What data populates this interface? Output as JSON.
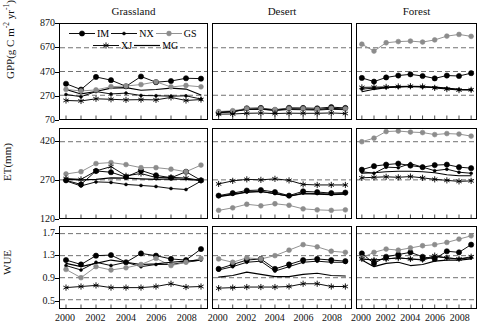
{
  "figure": {
    "column_titles": [
      "Grassland",
      "Desert",
      "Forest"
    ],
    "row_labels": [
      "GPP(g C m-2 yr-1)",
      "ET(mm)",
      "WUE"
    ]
  },
  "legend": {
    "entries": [
      {
        "key": "IM",
        "label": "IM",
        "marker": "circle-large",
        "color": "#000000"
      },
      {
        "key": "NX",
        "label": "NX",
        "marker": "circle-small",
        "color": "#000000"
      },
      {
        "key": "GS",
        "label": "GS",
        "marker": "circle-gray",
        "color": "#8c8c8c"
      },
      {
        "key": "XJ",
        "label": "XJ",
        "marker": "asterisk",
        "color": "#000000"
      },
      {
        "key": "MG",
        "label": "MG",
        "marker": "line",
        "color": "#000000"
      }
    ]
  },
  "axes": {
    "gpp": {
      "label": "GPP(g C m",
      "label_sup1": "-2",
      "label_mid": " yr",
      "label_sup2": "-1",
      "label_end": ")",
      "ticks": [
        70,
        270,
        470,
        670,
        870
      ],
      "min": 70,
      "max": 870
    },
    "et": {
      "label": "ET(mm)",
      "ticks": [
        120,
        270,
        420
      ],
      "min": 120,
      "max": 470
    },
    "wue": {
      "label": "WUE",
      "ticks": [
        0.5,
        0.9,
        1.3,
        1.7
      ],
      "min": 0.35,
      "max": 1.82
    }
  },
  "xaxis": {
    "ticks": [
      "2000",
      "2002",
      "2004",
      "2006",
      "2008"
    ],
    "years": [
      2000,
      2001,
      2002,
      2003,
      2004,
      2005,
      2006,
      2007,
      2008,
      2009
    ],
    "min": 1999.6,
    "max": 2009.4
  },
  "chart_data": {
    "type": "line",
    "title": "",
    "xlabel": "",
    "grid": true,
    "legend_position": "top-left-panel",
    "x": [
      2000,
      2001,
      2002,
      2003,
      2004,
      2005,
      2006,
      2007,
      2008,
      2009
    ],
    "panels": [
      {
        "row": "GPP",
        "column": "Grassland",
        "ylabel": "GPP(g C m-2 yr-1)",
        "ylim": [
          70,
          870
        ],
        "yticks": [
          70,
          270,
          470,
          670,
          870
        ],
        "series": [
          {
            "name": "IM",
            "values": [
              367,
              318,
              424,
              397,
              345,
              428,
              380,
              390,
              413,
              410
            ]
          },
          {
            "name": "NX",
            "values": [
              276,
              258,
              301,
              281,
              288,
              268,
              266,
              262,
              265,
              238
            ]
          },
          {
            "name": "GS",
            "values": [
              319,
              306,
              315,
              342,
              348,
              360,
              383,
              340,
              352,
              341
            ]
          },
          {
            "name": "XJ",
            "values": [
              226,
              222,
              240,
              236,
              231,
              233,
              231,
              252,
              226,
              234
            ]
          },
          {
            "name": "MG",
            "values": [
              318,
              281,
              302,
              330,
              334,
              312,
              318,
              330,
              322,
              272
            ]
          }
        ]
      },
      {
        "row": "GPP",
        "column": "Desert",
        "ylabel": "",
        "ylim": [
          70,
          870
        ],
        "yticks": [
          70,
          270,
          470,
          670,
          870
        ],
        "series": [
          {
            "name": "IM",
            "values": [
              124,
              130,
              160,
              163,
              146,
              164,
              163,
              160,
              170,
              163
            ]
          },
          {
            "name": "NX",
            "values": [
              128,
              135,
              150,
              152,
              142,
              150,
              148,
              145,
              152,
              148
            ]
          },
          {
            "name": "GS",
            "values": [
              133,
              140,
              158,
              158,
              150,
              158,
              157,
              152,
              160,
              156
            ]
          },
          {
            "name": "XJ",
            "values": [
              111,
              112,
              118,
              120,
              116,
              119,
              118,
              118,
              121,
              116
            ]
          },
          {
            "name": "MG",
            "values": [
              126,
              132,
              152,
              155,
              144,
              156,
              154,
              150,
              160,
              152
            ]
          }
        ]
      },
      {
        "row": "GPP",
        "column": "Forest",
        "ylabel": "",
        "ylim": [
          70,
          870
        ],
        "yticks": [
          70,
          270,
          470,
          670,
          870
        ],
        "series": [
          {
            "name": "IM",
            "values": [
              416,
              385,
              420,
              436,
              446,
              432,
              412,
              436,
              432,
              456
            ]
          },
          {
            "name": "NX",
            "values": [
              322,
              330,
              336,
              340,
              344,
              340,
              334,
              326,
              318,
              316
            ]
          },
          {
            "name": "GS",
            "values": [
              700,
              642,
              712,
              722,
              726,
              718,
              736,
              768,
              782,
              766
            ]
          },
          {
            "name": "XJ",
            "values": [
              336,
              338,
              340,
              344,
              346,
              344,
              332,
              322,
              314,
              316
            ]
          },
          {
            "name": "MG",
            "values": [
              300,
              320,
              334,
              340,
              344,
              342,
              338,
              330,
              320,
              316
            ]
          }
        ]
      },
      {
        "row": "ET",
        "column": "Grassland",
        "ylabel": "ET(mm)",
        "ylim": [
          120,
          470
        ],
        "yticks": [
          120,
          270,
          420
        ],
        "series": [
          {
            "name": "IM",
            "values": [
              268,
              252,
              305,
              300,
              281,
              307,
              288,
              278,
              302,
              268
            ]
          },
          {
            "name": "NX",
            "values": [
              266,
              246,
              262,
              260,
              252,
              248,
              244,
              236,
              232,
              265
            ]
          },
          {
            "name": "GS",
            "values": [
              293,
              302,
              334,
              338,
              330,
              318,
              318,
              312,
              302,
              328
            ]
          },
          {
            "name": "XJ",
            "values": [
              275,
              272,
              305,
              322,
              286,
              295,
              279,
              280,
              277,
              268
            ]
          },
          {
            "name": "MG",
            "values": [
              272,
              270,
              272,
              278,
              277,
              274,
              272,
              274,
              272,
              268
            ]
          }
        ]
      },
      {
        "row": "ET",
        "column": "Desert",
        "ylabel": "",
        "ylim": [
          120,
          470
        ],
        "yticks": [
          120,
          270,
          420
        ],
        "series": [
          {
            "name": "IM",
            "values": [
              208,
              218,
              228,
              230,
              222,
              208,
              225,
              222,
              218,
              220
            ]
          },
          {
            "name": "NX",
            "values": [
              205,
              214,
              222,
              224,
              216,
              205,
              218,
              216,
              214,
              216
            ]
          },
          {
            "name": "GS",
            "values": [
              150,
              160,
              174,
              168,
              176,
              170,
              156,
              152,
              150,
              152
            ]
          },
          {
            "name": "XJ",
            "values": [
              254,
              266,
              272,
              270,
              274,
              268,
              252,
              250,
              250,
              250
            ]
          },
          {
            "name": "MG",
            "values": [
              204,
              212,
              222,
              224,
              216,
              206,
              216,
              214,
              212,
              214
            ]
          }
        ]
      },
      {
        "row": "ET",
        "column": "Forest",
        "ylabel": "",
        "ylim": [
          120,
          470
        ],
        "yticks": [
          120,
          270,
          420
        ],
        "series": [
          {
            "name": "IM",
            "values": [
              310,
              324,
              330,
              334,
              326,
              320,
              328,
              330,
              320,
              316
            ]
          },
          {
            "name": "NX",
            "values": [
              302,
              296,
              320,
              318,
              334,
              320,
              306,
              312,
              300,
              296
            ]
          },
          {
            "name": "GS",
            "values": [
              420,
              434,
              460,
              462,
              458,
              456,
              448,
              452,
              450,
              442
            ]
          },
          {
            "name": "XJ",
            "values": [
              278,
              280,
              282,
              280,
              283,
              278,
              272,
              268,
              264,
              266
            ]
          },
          {
            "name": "MG",
            "values": [
              296,
              298,
              302,
              304,
              304,
              302,
              298,
              290,
              286,
              286
            ]
          }
        ]
      },
      {
        "row": "WUE",
        "column": "Grassland",
        "ylabel": "WUE",
        "ylim": [
          0.35,
          1.82
        ],
        "yticks": [
          0.5,
          0.9,
          1.3,
          1.7
        ],
        "series": [
          {
            "name": "IM",
            "values": [
              1.22,
              1.14,
              1.3,
              1.31,
              1.18,
              1.34,
              1.3,
              1.24,
              1.22,
              1.42
            ]
          },
          {
            "name": "NX",
            "values": [
              1.12,
              1.04,
              1.18,
              1.12,
              1.18,
              1.1,
              1.14,
              1.14,
              1.18,
              1.22
            ]
          },
          {
            "name": "GS",
            "values": [
              1.05,
              0.9,
              1.1,
              1.04,
              1.08,
              1.14,
              1.25,
              1.12,
              1.18,
              1.25
            ]
          },
          {
            "name": "XJ",
            "values": [
              0.72,
              0.74,
              0.76,
              0.72,
              0.72,
              0.72,
              0.74,
              0.79,
              0.73,
              0.74
            ]
          },
          {
            "name": "MG",
            "values": [
              1.16,
              1.1,
              1.16,
              1.22,
              1.18,
              1.14,
              1.15,
              1.18,
              1.2,
              1.22
            ]
          }
        ]
      },
      {
        "row": "WUE",
        "column": "Desert",
        "ylabel": "",
        "ylim": [
          0.35,
          1.82
        ],
        "yticks": [
          0.5,
          0.9,
          1.3,
          1.7
        ],
        "series": [
          {
            "name": "IM",
            "values": [
              1.06,
              1.14,
              1.22,
              1.24,
              1.06,
              1.14,
              1.22,
              1.24,
              1.22,
              1.2
            ]
          },
          {
            "name": "NX",
            "values": [
              1.04,
              1.1,
              1.18,
              1.2,
              1.02,
              1.1,
              1.18,
              1.2,
              1.18,
              1.18
            ]
          },
          {
            "name": "GS",
            "values": [
              1.24,
              1.18,
              1.26,
              1.24,
              1.3,
              1.4,
              1.5,
              1.46,
              1.38,
              1.36
            ]
          },
          {
            "name": "XJ",
            "values": [
              0.71,
              0.72,
              0.73,
              0.73,
              0.73,
              0.74,
              0.79,
              0.79,
              0.74,
              0.74
            ]
          },
          {
            "name": "MG",
            "values": [
              0.91,
              0.94,
              1.0,
              0.96,
              0.92,
              0.92,
              0.96,
              0.98,
              0.94,
              0.93
            ]
          }
        ]
      },
      {
        "row": "WUE",
        "column": "Forest",
        "ylabel": "",
        "ylim": [
          0.35,
          1.82
        ],
        "yticks": [
          0.5,
          0.9,
          1.3,
          1.7
        ],
        "series": [
          {
            "name": "IM",
            "values": [
              1.34,
              1.16,
              1.28,
              1.32,
              1.36,
              1.28,
              1.24,
              1.38,
              1.36,
              1.5
            ]
          },
          {
            "name": "NX",
            "values": [
              1.24,
              1.22,
              1.24,
              1.26,
              1.24,
              1.22,
              1.28,
              1.26,
              1.24,
              1.26
            ]
          },
          {
            "name": "GS",
            "values": [
              1.26,
              1.36,
              1.42,
              1.4,
              1.44,
              1.48,
              1.5,
              1.54,
              1.6,
              1.66
            ]
          },
          {
            "name": "XJ",
            "values": [
              1.24,
              1.22,
              1.24,
              1.26,
              1.24,
              1.23,
              1.3,
              1.26,
              1.24,
              1.28
            ]
          },
          {
            "name": "MG",
            "values": [
              1.22,
              1.1,
              1.16,
              1.18,
              1.12,
              1.14,
              1.2,
              1.22,
              1.22,
              1.24
            ]
          }
        ]
      }
    ]
  }
}
